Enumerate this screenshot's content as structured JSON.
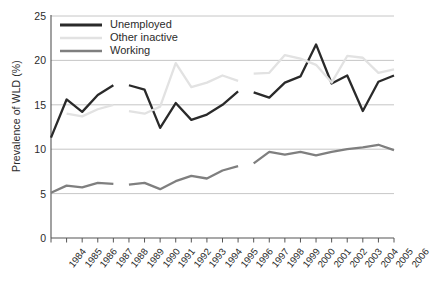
{
  "chart_data": {
    "type": "line",
    "title": "",
    "xlabel": "",
    "ylabel": "Prevalence of WLD (%)",
    "ylim": [
      0,
      25
    ],
    "ytick_values": [
      0,
      5,
      10,
      15,
      20,
      25
    ],
    "ytick_labels": [
      "0",
      "5",
      "10",
      "15",
      "20",
      "25"
    ],
    "grid": "horizontal",
    "legend_position": "top-left",
    "x": [
      1984,
      1985,
      1986,
      1987,
      1988,
      1989,
      1990,
      1991,
      1992,
      1993,
      1994,
      1995,
      1996,
      1997,
      1998,
      1999,
      2000,
      2001,
      2002,
      2003,
      2004,
      2005,
      2006
    ],
    "categories": [
      "1984",
      "1985",
      "1986",
      "1987",
      "1988",
      "1989",
      "1990",
      "1991",
      "1992",
      "1993",
      "1994",
      "1995",
      "1996",
      "1997",
      "1998",
      "1999",
      "2000",
      "2001",
      "2002",
      "2003",
      "2004",
      "2005",
      "2006"
    ],
    "series": [
      {
        "name": "Unemployed",
        "color": "#2a2a2a",
        "values": [
          11.3,
          15.6,
          14.2,
          16.1,
          17.2,
          17.2,
          16.7,
          12.4,
          15.2,
          13.3,
          13.9,
          15.0,
          16.5,
          16.4,
          15.8,
          17.5,
          18.2,
          21.8,
          17.4,
          18.3,
          14.3,
          17.6,
          18.3
        ],
        "breaks_after": [
          1988,
          1996
        ]
      },
      {
        "name": "Other inactive",
        "color": "#e2e2e2",
        "values": [
          null,
          14.0,
          13.7,
          14.5,
          15.0,
          14.3,
          14.0,
          14.8,
          19.7,
          17.0,
          17.5,
          18.3,
          17.7,
          18.5,
          18.6,
          20.6,
          20.2,
          19.5,
          17.5,
          20.5,
          20.3,
          18.6,
          19.0
        ],
        "breaks_after": [
          1988,
          1996
        ]
      },
      {
        "name": "Working",
        "color": "#7f7f7f",
        "values": [
          5.1,
          5.9,
          5.7,
          6.2,
          6.1,
          6.0,
          6.2,
          5.5,
          6.4,
          7.0,
          6.7,
          7.6,
          8.1,
          8.4,
          9.7,
          9.4,
          9.7,
          9.3,
          9.7,
          10.0,
          10.2,
          10.5,
          9.9
        ],
        "breaks_after": [
          1988,
          1996
        ]
      }
    ]
  },
  "legend": {
    "items": [
      {
        "label": "Unemployed"
      },
      {
        "label": "Other inactive"
      },
      {
        "label": "Working"
      }
    ]
  },
  "colors": {
    "unemployed": "#2a2a2a",
    "other_inactive": "#e2e2e2",
    "working": "#7f7f7f",
    "grid": "#b8b8b8",
    "axis": "#555555",
    "text": "#2b2b2b",
    "background": "#ffffff"
  }
}
